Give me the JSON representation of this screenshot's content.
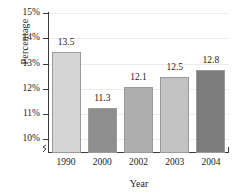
{
  "chart_data": {
    "type": "bar",
    "title": "",
    "subtitle": "",
    "xlabel": "Year",
    "ylabel": "Percentage",
    "categories": [
      "1990",
      "2000",
      "2002",
      "2003",
      "2004"
    ],
    "values": [
      13.5,
      11.3,
      12.1,
      12.5,
      12.8
    ],
    "value_labels": [
      "13.5",
      "11.3",
      "12.1",
      "12.5",
      "12.8"
    ],
    "bar_colors": [
      "#d5d5d5",
      "#8e8e8e",
      "#aeaeae",
      "#c2c2c2",
      "#7c7c7c"
    ],
    "ylim": [
      9.5,
      15
    ],
    "ytick_values": [
      10,
      11,
      12,
      13,
      14,
      15
    ],
    "ytick_labels": [
      "10%",
      "11%",
      "12%",
      "13%",
      "14%",
      "15%"
    ],
    "axis_break": true,
    "grid": true,
    "legend": "none",
    "axis_color": "#3a3a3a",
    "grid_color": "#ececec",
    "text_color": "#1a1a1a"
  }
}
